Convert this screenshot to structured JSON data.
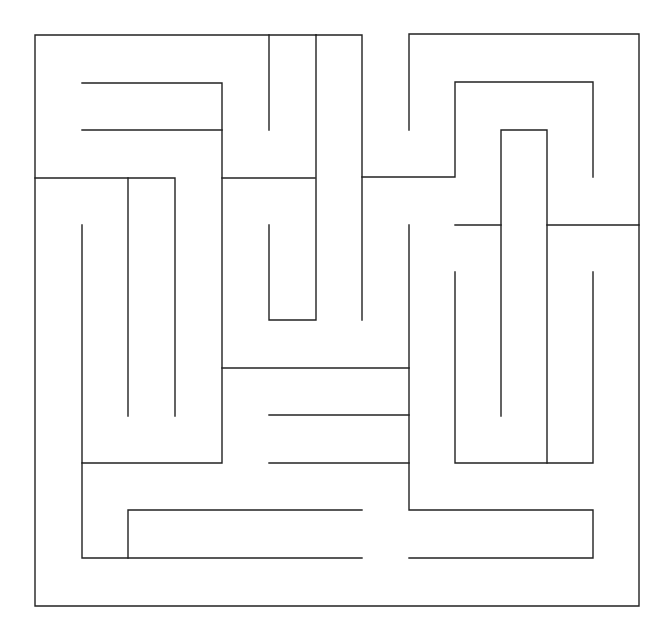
{
  "maze": {
    "width": 671,
    "height": 638,
    "stroke_color": "#222222",
    "background_color": "#ffffff",
    "polylines": [
      [
        [
          316,
          35
        ],
        [
          35,
          35
        ],
        [
          35,
          606
        ],
        [
          639,
          606
        ],
        [
          639,
          225
        ]
      ],
      [
        [
          269,
          35
        ],
        [
          269,
          130
        ]
      ],
      [
        [
          82,
          83
        ],
        [
          222,
          83
        ],
        [
          222,
          463
        ],
        [
          82,
          463
        ],
        [
          82,
          225
        ]
      ],
      [
        [
          82,
          130
        ],
        [
          222,
          130
        ]
      ],
      [
        [
          35,
          178
        ],
        [
          175,
          178
        ],
        [
          175,
          416
        ]
      ],
      [
        [
          128,
          178
        ],
        [
          128,
          416
        ]
      ],
      [
        [
          222,
          178
        ],
        [
          315,
          178
        ]
      ],
      [
        [
          316,
          35
        ],
        [
          362,
          35
        ],
        [
          362,
          320
        ]
      ],
      [
        [
          316,
          35
        ],
        [
          316,
          320
        ],
        [
          269,
          320
        ],
        [
          269,
          225
        ]
      ],
      [
        [
          409,
          130
        ],
        [
          409,
          34
        ],
        [
          639,
          34
        ],
        [
          639,
          225
        ],
        [
          547,
          225
        ]
      ],
      [
        [
          362,
          177
        ],
        [
          455,
          177
        ],
        [
          455,
          82
        ],
        [
          593,
          82
        ],
        [
          593,
          177
        ]
      ],
      [
        [
          501,
          416
        ],
        [
          501,
          130
        ],
        [
          547,
          130
        ],
        [
          547,
          463
        ]
      ],
      [
        [
          455,
          225
        ],
        [
          501,
          225
        ]
      ],
      [
        [
          455,
          272
        ],
        [
          455,
          463
        ],
        [
          593,
          463
        ],
        [
          593,
          272
        ]
      ],
      [
        [
          222,
          368
        ],
        [
          409,
          368
        ]
      ],
      [
        [
          269,
          415
        ],
        [
          409,
          415
        ]
      ],
      [
        [
          269,
          463
        ],
        [
          409,
          463
        ]
      ],
      [
        [
          409,
          225
        ],
        [
          409,
          510
        ],
        [
          593,
          510
        ],
        [
          593,
          558
        ],
        [
          409,
          558
        ]
      ],
      [
        [
          82,
          463
        ],
        [
          82,
          558
        ],
        [
          362,
          558
        ]
      ],
      [
        [
          128,
          558
        ],
        [
          128,
          510
        ],
        [
          362,
          510
        ]
      ]
    ]
  }
}
